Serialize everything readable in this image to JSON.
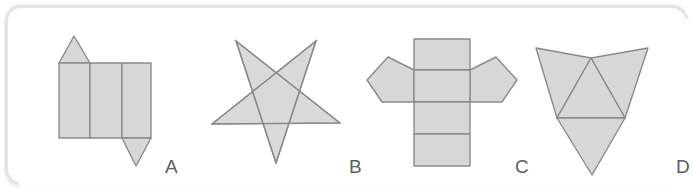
{
  "panel": {
    "background_color": "#ffffff",
    "frame_color": "#e4e4e4",
    "shape_fill": "#d7d7d7",
    "shape_stroke": "#8a8a8a",
    "label_color": "#5c5c5c"
  },
  "figures": [
    {
      "id": "figure-a",
      "label": "A",
      "shape_name": "triangular-prism-net",
      "description": "Net made of three adjacent rectangles with one upward triangle above the left rectangle and one downward triangle below the right rectangle"
    },
    {
      "id": "figure-b",
      "label": "B",
      "shape_name": "five-pointed-star-pentagram",
      "description": "Five pointed star drawn as a pentagram with one point facing downward"
    },
    {
      "id": "figure-c",
      "label": "C",
      "shape_name": "pentagonal-prism-net",
      "description": "Net made of a vertical column of four rectangles with a pentagon attached to the left and right of the second rectangle"
    },
    {
      "id": "figure-d",
      "label": "D",
      "shape_name": "tetrahedron-net",
      "description": "Net made of a central upward triangle with three surrounding triangular faces forming an inverted arrowhead"
    }
  ],
  "geometry": {
    "figure_a": {
      "rect1": {
        "x": 51,
        "y": 55,
        "w": 31,
        "h": 75
      },
      "rect2": {
        "x": 82,
        "y": 55,
        "w": 32,
        "h": 75
      },
      "rect3": {
        "x": 114,
        "y": 55,
        "w": 29,
        "h": 75
      },
      "top_triangle": "51,55 82,55 66,28",
      "bottom_triangle": "114,130 143,130 128,158"
    },
    "figure_b": {
      "outer_points": "228,33 268,155 308,33 204,116 332,115",
      "star_bbox": {
        "x": 204,
        "y": 33,
        "w": 128,
        "h": 122
      }
    },
    "figure_c": {
      "strip": {
        "x": 406,
        "y": 31,
        "w": 56,
        "h": 127
      },
      "dividers_y": [
        62,
        94,
        126
      ],
      "left_pentagon": "406,62 380,49 359,72 374,94 406,94",
      "right_pentagon": "462,62 488,49 509,72 494,94 462,94"
    },
    "figure_d": {
      "center_triangle": "583,50 617,110 549,110",
      "left_flap": "549,110 583,50 528,40",
      "right_flap": "617,110 583,50 640,40",
      "bottom_flap": "549,110 617,110 584,167"
    }
  }
}
